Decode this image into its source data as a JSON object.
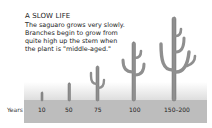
{
  "title": "A SLOW LIFE",
  "body_lines": [
    "The saguaro grows very slowly.",
    "Branches begin to grow from",
    "quite high up the stem when",
    "the plant is \"middle-aged.\""
  ],
  "axis_label": "Years",
  "stages": [
    {
      "label": "10"
    },
    {
      "label": "50"
    },
    {
      "label": "75"
    },
    {
      "label": "100"
    },
    {
      "label": "150–200"
    }
  ],
  "colors": {
    "cactus": "#8f8f8f",
    "ground": "#bdbdbd",
    "sky": "#e4e4e4"
  }
}
